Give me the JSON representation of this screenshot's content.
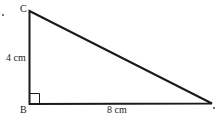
{
  "figure": {
    "type": "right triangle",
    "vertices": {
      "C": {
        "label": "C",
        "x": 29,
        "y": 11
      },
      "B": {
        "label": "B",
        "x": 29,
        "y": 104
      },
      "A": {
        "label": "",
        "x": 212,
        "y": 103
      }
    },
    "sides": {
      "CB": {
        "label": "4 cm"
      },
      "BA": {
        "label": "8 cm"
      }
    },
    "right_angle_at": "B",
    "stroke_color": "#1a1a1a"
  }
}
